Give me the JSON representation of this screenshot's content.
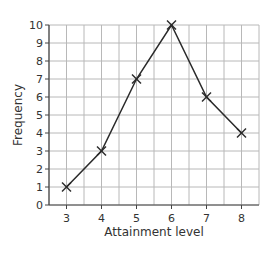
{
  "chart_data": {
    "type": "line",
    "title": "",
    "xlabel": "Attainment level",
    "ylabel": "Frequency",
    "x": [
      3,
      4,
      5,
      6,
      7,
      8
    ],
    "series": [
      {
        "name": "Frequency",
        "values": [
          1,
          3,
          7,
          10,
          6,
          4
        ],
        "marker": "x"
      }
    ],
    "x_ticks": [
      "3",
      "4",
      "5",
      "6",
      "7",
      "8"
    ],
    "y_ticks": [
      "0",
      "1",
      "2",
      "3",
      "4",
      "5",
      "6",
      "7",
      "8",
      "9",
      "10"
    ],
    "xlim": [
      2.5,
      8.5
    ],
    "ylim": [
      0,
      10
    ],
    "grid": true,
    "grid_minor_x": 0.5,
    "legend": null
  },
  "colors": {
    "line": "#2a2a2a",
    "grid": "#b8b8b8",
    "axis": "#444444",
    "text": "#333333"
  }
}
